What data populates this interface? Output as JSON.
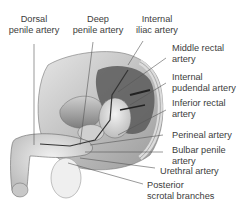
{
  "figure": {
    "labels": {
      "dorsal_penile_artery": [
        "Dorsal",
        "penile artery"
      ],
      "deep_penile_artery": [
        "Deep",
        "penile artery"
      ],
      "internal_iliac_artery": [
        "Internal",
        "iliac artery"
      ],
      "middle_rectal_artery": [
        "Middle rectal",
        "artery"
      ],
      "internal_pudendal_artery": [
        "Internal",
        "pudendal artery"
      ],
      "inferior_rectal_artery": [
        "Inferior rectal",
        "artery"
      ],
      "perineal_artery": [
        "Perineal artery"
      ],
      "bulbar_penile_artery": [
        "Bulbar penile",
        "artery"
      ],
      "urethral_artery": [
        "Urethral artery"
      ],
      "posterior_scrotal_branches": [
        "Posterior",
        "scrotal branches"
      ]
    }
  }
}
